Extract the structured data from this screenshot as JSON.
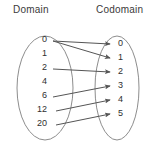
{
  "diagram": {
    "domain": {
      "title": "Domain",
      "elements": [
        {
          "label": "0",
          "x": 47,
          "y": 40
        },
        {
          "label": "1",
          "x": 47,
          "y": 54
        },
        {
          "label": "2",
          "x": 47,
          "y": 68
        },
        {
          "label": "4",
          "x": 47,
          "y": 82
        },
        {
          "label": "6",
          "x": 47,
          "y": 96
        },
        {
          "label": "12",
          "x": 47,
          "y": 110
        },
        {
          "label": "20",
          "x": 47,
          "y": 124
        }
      ]
    },
    "codomain": {
      "title": "Codomain",
      "elements": [
        {
          "label": "0",
          "x": 118,
          "y": 44
        },
        {
          "label": "1",
          "x": 118,
          "y": 58
        },
        {
          "label": "2",
          "x": 118,
          "y": 72
        },
        {
          "label": "3",
          "x": 118,
          "y": 86
        },
        {
          "label": "4",
          "x": 118,
          "y": 100
        },
        {
          "label": "5",
          "x": 118,
          "y": 114
        }
      ]
    },
    "mappings": [
      {
        "from": "0",
        "to": "0",
        "x1": 53,
        "y1": 41,
        "x2": 110,
        "y2": 44
      },
      {
        "from": "0",
        "to": "1",
        "x1": 53,
        "y1": 41,
        "x2": 110,
        "y2": 58
      },
      {
        "from": "2",
        "to": "2",
        "x1": 53,
        "y1": 69,
        "x2": 110,
        "y2": 72
      },
      {
        "from": "6",
        "to": "3",
        "x1": 53,
        "y1": 97,
        "x2": 110,
        "y2": 86
      },
      {
        "from": "12",
        "to": "4",
        "x1": 56,
        "y1": 111,
        "x2": 110,
        "y2": 100
      },
      {
        "from": "20",
        "to": "5",
        "x1": 56,
        "y1": 125,
        "x2": 110,
        "y2": 114
      }
    ],
    "shapes": {
      "domain_oval": {
        "cx": 45,
        "cy": 88,
        "rx": 28,
        "ry": 52
      },
      "codomain_oval": {
        "cx": 117,
        "cy": 88,
        "rx": 22,
        "ry": 52
      }
    },
    "colors": {
      "oval_stroke": "#8d8d8d",
      "arrow_stroke": "#555555",
      "text": "#2f2f2f",
      "title_text": "#3a3a3a",
      "background": "#ffffff"
    }
  }
}
